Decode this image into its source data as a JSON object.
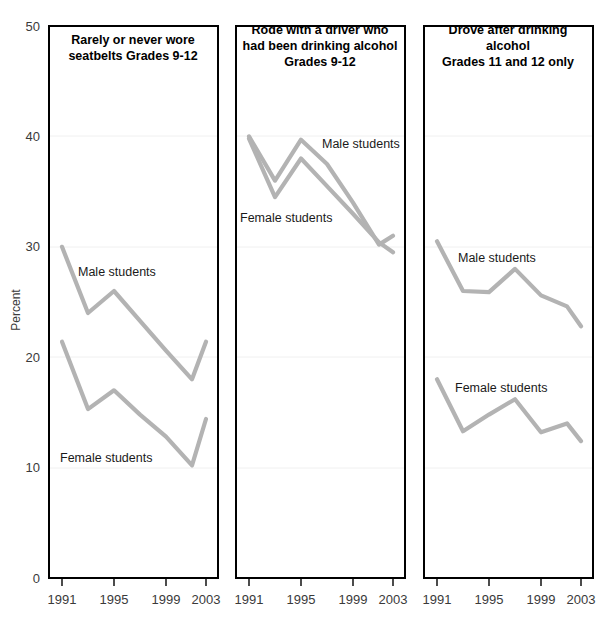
{
  "chart_data": {
    "type": "line",
    "title": "",
    "ylabel": "Percent",
    "xlabel": "",
    "ylim": [
      0,
      50
    ],
    "yticks": [
      0,
      10,
      20,
      30,
      40,
      50
    ],
    "ytick_labels": [
      "0",
      "10",
      "20",
      "30",
      "40",
      "50"
    ],
    "xlim": [
      1991,
      2003
    ],
    "xticks": [
      1991,
      1995,
      1999,
      2003
    ],
    "xtick_labels": [
      "1991",
      "1995",
      "1999",
      "2003"
    ],
    "x": [
      1991,
      1993,
      1995,
      1997,
      1999,
      2001,
      2003
    ],
    "grid": true,
    "legend_position": "inline-annotation",
    "series_color": "#b3b3b3",
    "panels": [
      {
        "title": "Rarely or never wore\nseatbelts Grades 9-12",
        "title_lines": [
          "Rarely or never wore",
          "seatbelts Grades 9-12"
        ],
        "series": [
          {
            "name": "Male students",
            "label": "Male students",
            "values": [
              30.0,
              24.0,
              26.0,
              23.3,
              20.6,
              18.0,
              21.4
            ]
          },
          {
            "name": "Female students",
            "label": "Female students",
            "values": [
              21.4,
              15.3,
              17.0,
              14.8,
              12.8,
              10.2,
              14.4
            ]
          }
        ]
      },
      {
        "title": "Rode with a driver who\nhad been drinking alcohol\nGrades 9-12",
        "title_lines": [
          "Rode with a driver who",
          "had been drinking alcohol",
          "Grades 9-12"
        ],
        "series": [
          {
            "name": "Male students",
            "label": "Male students",
            "values": [
              40.0,
              36.0,
              39.7,
              37.5,
              34.0,
              30.2,
              31.0
            ]
          },
          {
            "name": "Female students",
            "label": "Female students",
            "values": [
              39.8,
              34.5,
              38.0,
              35.5,
              33.0,
              30.4,
              29.5
            ]
          }
        ]
      },
      {
        "title": "Drove after drinking\nalcohol\nGrades 11 and 12 only",
        "title_lines": [
          "Drove after drinking",
          "alcohol",
          "Grades 11 and 12 only"
        ],
        "series": [
          {
            "name": "Male students",
            "label": "Male students",
            "values": [
              30.5,
              26.0,
              25.9,
              28.0,
              25.6,
              24.6,
              22.8
            ]
          },
          {
            "name": "Female students",
            "label": "Female students",
            "values": [
              18.0,
              13.3,
              14.8,
              16.2,
              13.2,
              14.0,
              12.4
            ]
          }
        ]
      }
    ]
  }
}
